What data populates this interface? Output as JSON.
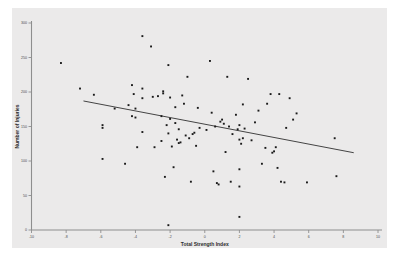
{
  "chart_data": {
    "type": "scatter",
    "title": "",
    "xlabel": "Total Strength Index",
    "ylabel": "Number of Injuries",
    "xlim": [
      -10,
      10
    ],
    "ylim": [
      0,
      300
    ],
    "xticks": [
      -10,
      -8,
      -6,
      -4,
      -2,
      0,
      2,
      4,
      6,
      8,
      10
    ],
    "xtick_labels": [
      "-10",
      "-8",
      "-6",
      "-4",
      "-2",
      "0",
      "2",
      "4",
      "6",
      "8",
      "10"
    ],
    "yticks": [
      0,
      50,
      100,
      150,
      200,
      250,
      300
    ],
    "ytick_labels": [
      "0",
      "50",
      "100",
      "150",
      "200",
      "250",
      "300"
    ],
    "grid": false,
    "legend": false,
    "marker": "square",
    "marker_color": "#1a1a1a",
    "panel_color": "#ebeaea",
    "axis_color": "#8e8e8e",
    "fit_line": {
      "type": "linear-regression",
      "color": "#444444",
      "x_start": -7.0,
      "y_start": 187,
      "x_end": 8.6,
      "y_end": 112
    },
    "points": [
      [
        -8.3,
        242
      ],
      [
        -7.2,
        205
      ],
      [
        -6.4,
        196
      ],
      [
        -5.9,
        152
      ],
      [
        -5.9,
        148
      ],
      [
        -5.9,
        103
      ],
      [
        -5.2,
        176
      ],
      [
        -4.6,
        96
      ],
      [
        -4.4,
        181
      ],
      [
        -4.2,
        210
      ],
      [
        -4.2,
        165
      ],
      [
        -4.1,
        197
      ],
      [
        -4.0,
        163
      ],
      [
        -4.0,
        176
      ],
      [
        -3.9,
        120
      ],
      [
        -3.6,
        281
      ],
      [
        -3.6,
        205
      ],
      [
        -3.6,
        191
      ],
      [
        -3.6,
        142
      ],
      [
        -3.1,
        266
      ],
      [
        -3.0,
        193
      ],
      [
        -2.9,
        120
      ],
      [
        -2.7,
        194
      ],
      [
        -2.5,
        129
      ],
      [
        -2.5,
        165
      ],
      [
        -2.4,
        201
      ],
      [
        -2.4,
        198
      ],
      [
        -2.3,
        77
      ],
      [
        -2.2,
        152
      ],
      [
        -2.1,
        239
      ],
      [
        -2.1,
        140
      ],
      [
        -2.1,
        7
      ],
      [
        -2.0,
        192
      ],
      [
        -2.0,
        161
      ],
      [
        -1.9,
        121
      ],
      [
        -1.8,
        91
      ],
      [
        -1.7,
        178
      ],
      [
        -1.7,
        155
      ],
      [
        -1.6,
        131
      ],
      [
        -1.5,
        126
      ],
      [
        -1.5,
        146
      ],
      [
        -1.4,
        127
      ],
      [
        -1.3,
        195
      ],
      [
        -1.2,
        183
      ],
      [
        -1.1,
        137
      ],
      [
        -1.0,
        222
      ],
      [
        -0.9,
        133
      ],
      [
        -0.8,
        70
      ],
      [
        -0.7,
        139
      ],
      [
        -0.6,
        141
      ],
      [
        -0.5,
        122
      ],
      [
        -0.4,
        177
      ],
      [
        -0.3,
        148
      ],
      [
        0.1,
        145
      ],
      [
        0.3,
        245
      ],
      [
        0.4,
        170
      ],
      [
        0.5,
        85
      ],
      [
        0.6,
        150
      ],
      [
        0.7,
        68
      ],
      [
        0.8,
        66
      ],
      [
        0.9,
        157
      ],
      [
        1.0,
        160
      ],
      [
        1.1,
        154
      ],
      [
        1.2,
        113
      ],
      [
        1.3,
        222
      ],
      [
        1.4,
        150
      ],
      [
        1.5,
        70
      ],
      [
        1.6,
        139
      ],
      [
        1.8,
        167
      ],
      [
        1.9,
        146
      ],
      [
        2.0,
        152
      ],
      [
        2.0,
        131
      ],
      [
        2.0,
        88
      ],
      [
        2.0,
        63
      ],
      [
        2.0,
        19
      ],
      [
        2.1,
        125
      ],
      [
        2.2,
        182
      ],
      [
        2.2,
        133
      ],
      [
        2.3,
        147
      ],
      [
        2.5,
        219
      ],
      [
        2.7,
        130
      ],
      [
        2.9,
        156
      ],
      [
        3.1,
        173
      ],
      [
        3.3,
        96
      ],
      [
        3.5,
        119
      ],
      [
        3.6,
        183
      ],
      [
        3.8,
        197
      ],
      [
        3.9,
        112
      ],
      [
        4.0,
        114
      ],
      [
        4.1,
        120
      ],
      [
        4.2,
        90
      ],
      [
        4.3,
        197
      ],
      [
        4.4,
        70
      ],
      [
        4.6,
        69
      ],
      [
        4.7,
        148
      ],
      [
        4.9,
        191
      ],
      [
        5.1,
        160
      ],
      [
        5.3,
        169
      ],
      [
        5.9,
        69
      ],
      [
        7.5,
        133
      ],
      [
        7.6,
        78
      ]
    ]
  },
  "axes": {
    "x_title": "Total Strength Index",
    "y_title": "Number of Injuries"
  }
}
